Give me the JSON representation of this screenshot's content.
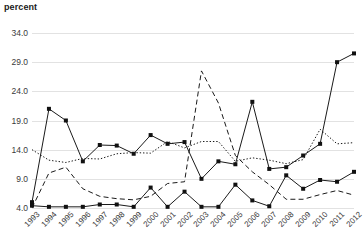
{
  "axis_title": "percent",
  "chart_data": {
    "type": "line",
    "title": "",
    "subtitle": "",
    "xlabel": "",
    "ylabel": "percent",
    "ylim": [
      4.0,
      34.0
    ],
    "yticks": [
      "4.0",
      "9.0",
      "14.0",
      "19.0",
      "24.0",
      "29.0",
      "34.0"
    ],
    "ytick_values": [
      4.0,
      9.0,
      14.0,
      19.0,
      24.0,
      29.0,
      34.0
    ],
    "grid": true,
    "legend": "none",
    "categories": [
      "1993",
      "1994",
      "1995",
      "1996",
      "1997",
      "1998",
      "1999",
      "2000",
      "2001",
      "2002",
      "2003",
      "2004",
      "2005",
      "2006",
      "2007",
      "2008",
      "2009",
      "2010",
      "2011",
      "2012"
    ],
    "series": [
      {
        "name": "series-1",
        "style": "solid",
        "marker": "square",
        "values": [
          5.0,
          21.0,
          19.0,
          12.0,
          14.8,
          14.7,
          13.3,
          16.5,
          15.0,
          15.3,
          9.0,
          12.0,
          11.5,
          22.2,
          10.7,
          11.0,
          13.0,
          15.0,
          29.0,
          30.5
        ]
      },
      {
        "name": "series-2",
        "style": "dotted",
        "marker": "none",
        "values": [
          14.0,
          12.2,
          11.8,
          12.5,
          12.4,
          13.3,
          13.5,
          13.4,
          15.4,
          14.3,
          15.4,
          15.4,
          12.0,
          12.6,
          12.2,
          11.6,
          12.3,
          17.5,
          15.0,
          15.2
        ]
      },
      {
        "name": "series-3",
        "style": "dashed",
        "marker": "none",
        "values": [
          4.0,
          10.0,
          11.0,
          7.3,
          6.0,
          5.6,
          5.4,
          6.0,
          8.2,
          8.5,
          27.5,
          22.0,
          13.0,
          10.2,
          8.0,
          5.5,
          5.5,
          6.3,
          7.0,
          6.2
        ]
      },
      {
        "name": "series-4",
        "style": "solid",
        "marker": "square",
        "values": [
          4.4,
          4.2,
          4.2,
          4.2,
          4.6,
          4.6,
          4.2,
          7.5,
          4.2,
          6.8,
          4.2,
          4.2,
          8.0,
          5.3,
          4.3,
          9.6,
          7.3,
          8.8,
          8.5,
          10.2
        ]
      }
    ]
  }
}
